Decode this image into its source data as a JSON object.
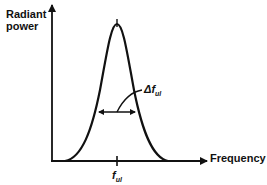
{
  "diagram": {
    "y_axis_label_line1": "Radiant",
    "y_axis_label_line2": "power",
    "x_axis_label": "Frequency",
    "linewidth_label": "Δf",
    "linewidth_label_subscript": "ul",
    "center_freq_label": "f",
    "center_freq_label_subscript": "ul",
    "line_color": "#111111",
    "background": "#ffffff",
    "curve": "Gaussian-shaped emission line profile centered at f_ul"
  }
}
